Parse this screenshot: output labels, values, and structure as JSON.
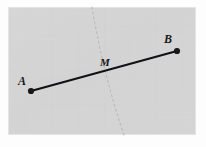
{
  "figure": {
    "kind": "geometry-line-segment-diagram",
    "canvas": {
      "width": 206,
      "height": 147
    },
    "panel": {
      "x": 8,
      "y": 7,
      "width": 188,
      "height": 128,
      "fill_color": "#d4d4d4",
      "texture_color": "#cdcdcd",
      "border_color": "#e8e8e8"
    },
    "background_color": "#fdfdfd"
  },
  "segment": {
    "name": "AB",
    "color": "#101114",
    "stroke_width": 2.1,
    "start": {
      "x": 31,
      "y": 91
    },
    "end": {
      "x": 177,
      "y": 51
    }
  },
  "points": [
    {
      "id": "A",
      "label": "A",
      "dot": {
        "x": 31,
        "y": 91,
        "r": 3.1
      },
      "label_pos": {
        "x": 22,
        "y": 85
      },
      "font_size": 12,
      "color": "#17181a"
    },
    {
      "id": "B",
      "label": "B",
      "dot": {
        "x": 177,
        "y": 51,
        "r": 3.1
      },
      "label_pos": {
        "x": 168,
        "y": 43
      },
      "font_size": 12,
      "color": "#17181a"
    },
    {
      "id": "M",
      "label": "M",
      "dot": null,
      "label_pos": {
        "x": 105,
        "y": 66
      },
      "font_size": 11,
      "color": "#17181a"
    }
  ],
  "dotted_curve": {
    "name": "fold-crease",
    "color": "#b9b9b9",
    "stroke_width": 1.1,
    "dash_pattern": "2 3",
    "path": "M 92 7 C 95 26, 99 44, 103 62 C 108 82, 114 106, 124 135"
  }
}
